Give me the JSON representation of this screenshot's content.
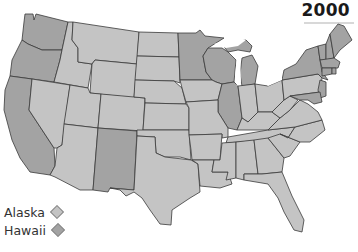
{
  "title": {
    "year": "2000"
  },
  "legend": {
    "items": [
      {
        "label": "Alaska",
        "shade": "light",
        "color": "#c4c4c4"
      },
      {
        "label": "Hawaii",
        "shade": "dark",
        "color": "#a3a3a3"
      }
    ]
  },
  "colors": {
    "light": "#c4c4c4",
    "dark": "#a3a3a3",
    "border": "#3a3a3a",
    "background": "#ffffff",
    "lakes": "#ffffff"
  },
  "map": {
    "region": "Contiguous United States",
    "dark_states": [
      "WA",
      "OR",
      "CA",
      "NM",
      "MN",
      "WI",
      "MI",
      "IL",
      "NY",
      "VT",
      "NH",
      "ME",
      "MA",
      "RI",
      "CT",
      "NJ",
      "DE",
      "MD"
    ],
    "light_states": [
      "ID",
      "MT",
      "WY",
      "NV",
      "UT",
      "CO",
      "AZ",
      "ND",
      "SD",
      "NE",
      "KS",
      "OK",
      "TX",
      "IA",
      "MO",
      "AR",
      "LA",
      "IN",
      "OH",
      "KY",
      "TN",
      "MS",
      "AL",
      "GA",
      "FL",
      "SC",
      "NC",
      "VA",
      "WV",
      "PA"
    ]
  }
}
